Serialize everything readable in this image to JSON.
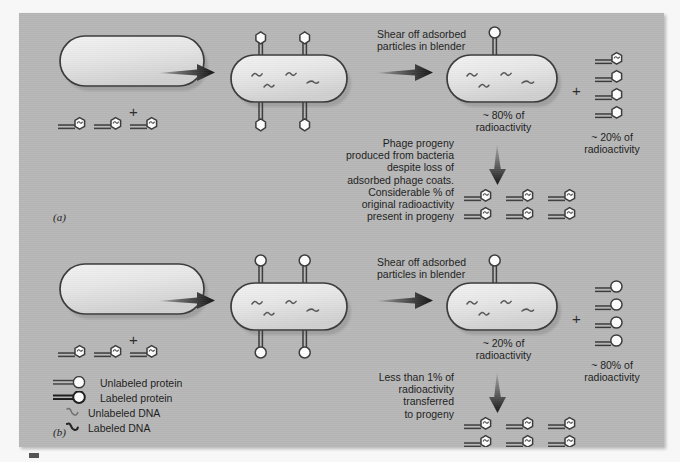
{
  "figure": {
    "background_color": "#b7b7b7",
    "page_color": "#fbfbfb",
    "outline_color": "#3a3a3a"
  },
  "panels": [
    {
      "letter": "(a)",
      "experiment": "labeled protein coat",
      "shear_label": "Shear off adsorbed\nparticles in blender",
      "bacterium_radioactivity": "~ 80% of\nradioactivity",
      "ghost_radioactivity": "~ 20% of\nradioactivity",
      "progeny_note": "Phage progeny\nproduced from bacteria\ndespite loss of\nadsorbed phage coats.\nConsiderable % of\noriginal radioactivity\npresent in progeny",
      "plus": "+",
      "start_plus": "+",
      "phage_count_start": 3,
      "ghost_count": 4,
      "progeny_count": 6,
      "head_style": "hex-dna",
      "ghost_head_style": "hex-empty"
    },
    {
      "letter": "(b)",
      "experiment": "labeled DNA",
      "shear_label": "Shear off adsorbed\nparticles in blender",
      "bacterium_radioactivity": "~ 20% of\nradioactivity",
      "ghost_radioactivity": "~ 80% of\nradioactivity",
      "progeny_note": "Less than 1% of\nradioactivity\ntransferred\nto progeny",
      "plus": "+",
      "start_plus": "+",
      "phage_count_start": 3,
      "ghost_count": 4,
      "progeny_count": 6,
      "head_style": "hex-dna",
      "ghost_head_style": "round-empty"
    }
  ],
  "legend": {
    "items": [
      {
        "glyph": "phage-unlabeled-protein-icon",
        "label": "Unlabeled protein"
      },
      {
        "glyph": "phage-labeled-protein-icon",
        "label": "Labeled protein"
      },
      {
        "glyph": "dna-unlabeled-icon",
        "label": "Unlabeled DNA"
      },
      {
        "glyph": "dna-labeled-icon",
        "label": "Labeled DNA"
      }
    ]
  }
}
